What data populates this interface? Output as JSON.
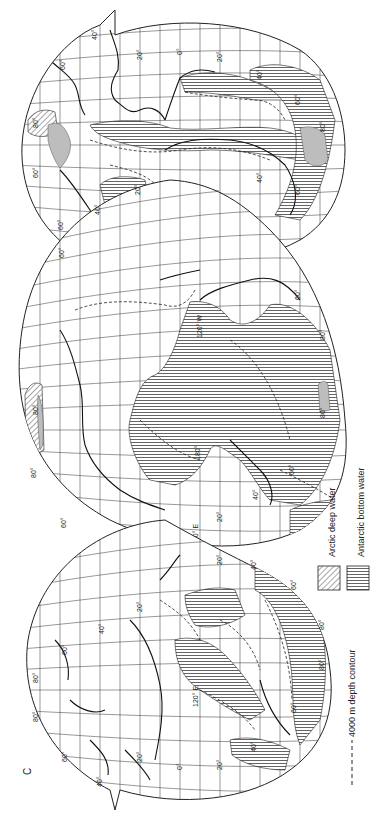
{
  "figure": {
    "panel_letter": "C",
    "orientation": "rotated 90° counter-clockwise (landscape figure placed in portrait page)",
    "projection": "interrupted equal-area world map, three lobes (Atlantic, Pacific, Indian)"
  },
  "legend": {
    "items": [
      {
        "label": "Arctic deep water",
        "pattern": "diagonal-hatch"
      },
      {
        "label": "Antarctic bottom water",
        "pattern": "vertical-hatch"
      },
      {
        "label": "4000 m depth contour",
        "pattern": "dashed-line"
      }
    ]
  },
  "lobes": {
    "atlantic": {
      "labels": {
        "lat_n40": "40°",
        "lat_n60": "60°",
        "lat_n80": "80°",
        "lat_n60b": "60°",
        "lon_20w": "20°",
        "lon_0": "0°",
        "lon_20e": "20°",
        "lat_s40": "40°",
        "lat_s60": "60°",
        "lat_s80": "80°",
        "lat_s60b": "60°",
        "lat_s40b": "40°",
        "w_marker": "W",
        "lon_60w": "60°",
        "lon_20w_b": "20°",
        "lat_s20": "20°",
        "lat_60_left": "60°"
      }
    },
    "pacific": {
      "labels": {
        "lat_n20": "20°",
        "lat_n40": "40°",
        "lat_n60": "60°",
        "lat_n80": "80°",
        "lat_n80b": "80°",
        "lat_n60b": "60°",
        "lat_n40b": "40°",
        "lon_120w": "120° W",
        "lon_180": "180°",
        "lon_120e": "120° E",
        "lat_s20": "20°",
        "lat_s40": "40°",
        "lat_s60": "60°",
        "lat_s80": "80°",
        "lat_s60b": "60°",
        "lat_s80b": "80°",
        "lat_s40b": "40°",
        "lat_s20b": "20°"
      }
    },
    "indian": {
      "labels": {
        "lat_n40": "40°",
        "lat_n60": "60°",
        "lat_n80": "80°",
        "lat_n80b": "80°",
        "lat_n60b": "60°",
        "lat_n40b": "40°",
        "lat_n20": "20°",
        "lat_n20b": "20°",
        "lon_0": "0°",
        "lon_20": "20°",
        "lon_120e": "120° E",
        "lat_s40": "40°",
        "lat_s60": "60°",
        "lat_s80": "80°",
        "lat_s80b": "80°",
        "lat_s60b": "60°",
        "lat_s40b": "40°",
        "lat_s20": "20°"
      }
    }
  }
}
